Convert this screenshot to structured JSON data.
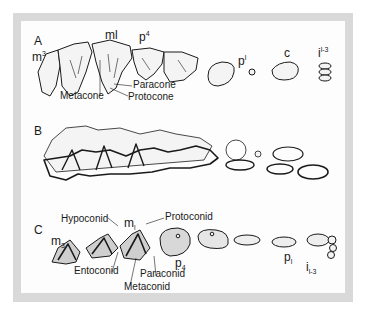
{
  "figure": {
    "frame_color": "#d9d9d9",
    "panel_color": "#fdfdfd",
    "ink_color": "#1a1a1a",
    "panels": [
      {
        "id": "A",
        "letter": "A",
        "description": "Upper dentition, lateral view",
        "tooth_labels": [
          {
            "base": "m",
            "sup": "3"
          },
          {
            "base": "m",
            "sup": "l"
          },
          {
            "base": "p",
            "sup": "4"
          },
          {
            "base": "p",
            "sup": "l"
          },
          {
            "base": "c",
            "sup": ""
          },
          {
            "base": "i",
            "sup": "l-3"
          }
        ],
        "cusp_labels": [
          "Metacone",
          "Paracone",
          "Protocone"
        ]
      },
      {
        "id": "B",
        "letter": "B",
        "description": "Upper and lower dentition in occlusion (outline)"
      },
      {
        "id": "C",
        "letter": "C",
        "description": "Lower dentition, occlusal view",
        "tooth_labels": [
          {
            "base": "m",
            "sub": "3"
          },
          {
            "base": "m",
            "sub": "l"
          },
          {
            "base": "p",
            "sub": "4"
          },
          {
            "base": "p",
            "sub": "l"
          },
          {
            "base": "i",
            "sub": "l-3"
          }
        ],
        "cusp_labels": [
          "Hypoconid",
          "Protoconid",
          "Entoconid",
          "Paraconid",
          "Metaconid"
        ]
      }
    ]
  }
}
